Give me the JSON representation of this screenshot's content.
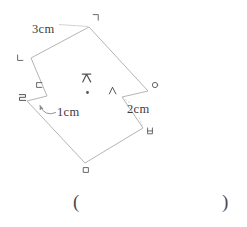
{
  "figure": {
    "vertex_labels": {
      "giyeok": "ㄱ",
      "nieun": "ㄴ",
      "digeut": "ㄷ",
      "rieul": "ㄹ",
      "mieum": "ㅁ",
      "bieup": "ㅂ",
      "siot": "ㅅ",
      "ieung": "ㅇ",
      "jieut": "ㅈ"
    },
    "measurements": {
      "edge_top_left": "3cm",
      "notch_left": "1cm",
      "notch_right": "2cm"
    },
    "colors": {
      "outline": "#b5b5b5",
      "glyph": "#545454",
      "measure_text": "#3c3c3c"
    }
  },
  "answer": {
    "open_paren": "(",
    "close_paren": ")"
  }
}
